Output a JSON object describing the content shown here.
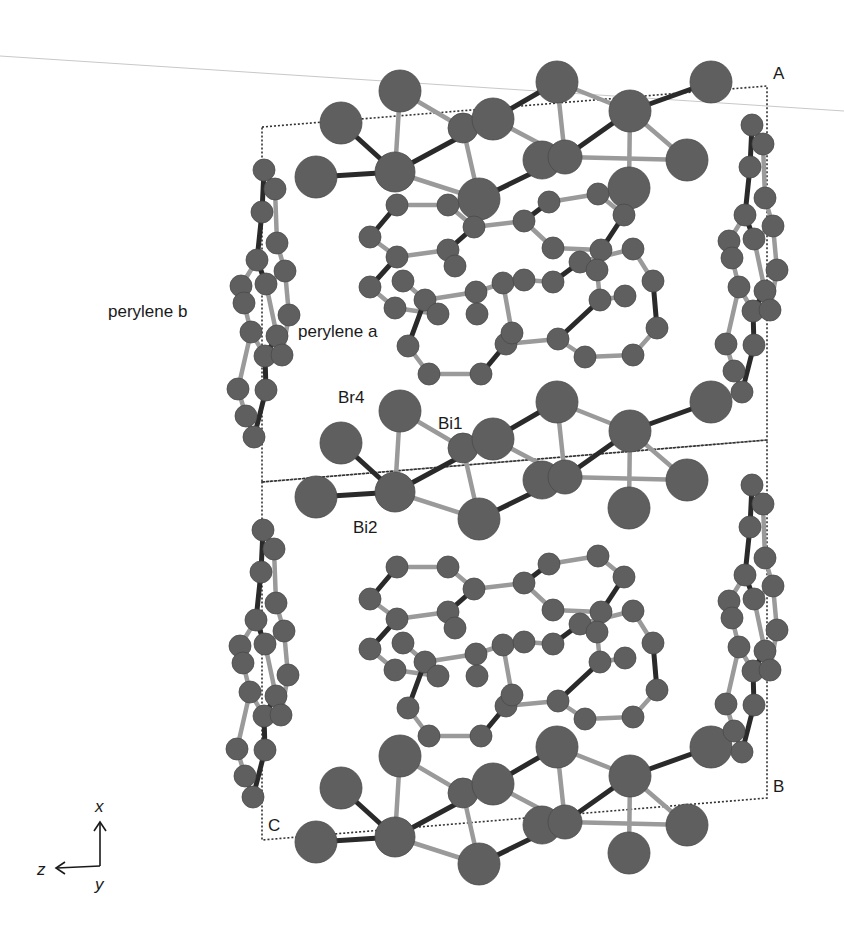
{
  "figure": {
    "colors": {
      "atom": "#5f5f5f",
      "atom_edge": "#4a4a4a",
      "bond_dark": "#2a2a2a",
      "bond_light": "#9a9a9a",
      "cell": "#333333",
      "text": "#1a1a1a",
      "guide_line": "#c8c8c8"
    }
  },
  "labels": {
    "perylene_a": "perylene a",
    "perylene_b": "perylene b",
    "br4": "Br4",
    "bi1": "Bi1",
    "bi2": "Bi2",
    "corner_a": "A",
    "corner_b": "B",
    "corner_c": "C"
  },
  "axes": {
    "x": "x",
    "y": "y",
    "z": "z"
  },
  "unit_cell": {
    "upper": [
      [
        262,
        127
      ],
      [
        767,
        86
      ],
      [
        767,
        440
      ],
      [
        262,
        482
      ]
    ],
    "lower": [
      [
        262,
        482
      ],
      [
        767,
        440
      ],
      [
        767,
        798
      ],
      [
        262,
        840
      ]
    ]
  },
  "inorganic_layer": {
    "atoms": [
      {
        "x": 400,
        "y": 411,
        "r": 21
      },
      {
        "x": 341,
        "y": 443,
        "r": 21
      },
      {
        "x": 316,
        "y": 497,
        "r": 21
      },
      {
        "x": 395,
        "y": 492,
        "r": 20
      },
      {
        "x": 463,
        "y": 448,
        "r": 15
      },
      {
        "x": 493,
        "y": 439,
        "r": 21
      },
      {
        "x": 479,
        "y": 519,
        "r": 21
      },
      {
        "x": 557,
        "y": 402,
        "r": 21
      },
      {
        "x": 542,
        "y": 480,
        "r": 19
      },
      {
        "x": 565,
        "y": 477,
        "r": 17
      },
      {
        "x": 630,
        "y": 431,
        "r": 21
      },
      {
        "x": 711,
        "y": 402,
        "r": 21
      },
      {
        "x": 687,
        "y": 480,
        "r": 21
      },
      {
        "x": 629,
        "y": 508,
        "r": 21
      }
    ],
    "bonds": [
      [
        0,
        3,
        "light"
      ],
      [
        1,
        3,
        "dark"
      ],
      [
        2,
        3,
        "dark"
      ],
      [
        3,
        5,
        "dark"
      ],
      [
        3,
        6,
        "light"
      ],
      [
        0,
        4,
        "light"
      ],
      [
        4,
        6,
        "light"
      ],
      [
        5,
        7,
        "dark"
      ],
      [
        5,
        9,
        "light"
      ],
      [
        6,
        9,
        "dark"
      ],
      [
        7,
        9,
        "light"
      ],
      [
        7,
        10,
        "light"
      ],
      [
        9,
        10,
        "dark"
      ],
      [
        9,
        12,
        "light"
      ],
      [
        10,
        11,
        "dark"
      ],
      [
        10,
        12,
        "light"
      ],
      [
        10,
        13,
        "light"
      ],
      [
        4,
        5,
        "dark"
      ]
    ],
    "offsets_y": [
      -320,
      0,
      345
    ]
  },
  "perylene_a": {
    "atoms": [
      {
        "x": 397,
        "y": 205
      },
      {
        "x": 448,
        "y": 205
      },
      {
        "x": 474,
        "y": 227
      },
      {
        "x": 524,
        "y": 221
      },
      {
        "x": 549,
        "y": 202
      },
      {
        "x": 598,
        "y": 194
      },
      {
        "x": 624,
        "y": 215
      },
      {
        "x": 601,
        "y": 250
      },
      {
        "x": 553,
        "y": 248
      },
      {
        "x": 448,
        "y": 250
      },
      {
        "x": 397,
        "y": 257
      },
      {
        "x": 370,
        "y": 237
      },
      {
        "x": 370,
        "y": 287
      },
      {
        "x": 395,
        "y": 308
      },
      {
        "x": 425,
        "y": 300
      },
      {
        "x": 476,
        "y": 292
      },
      {
        "x": 503,
        "y": 283
      },
      {
        "x": 524,
        "y": 280
      },
      {
        "x": 553,
        "y": 282
      },
      {
        "x": 580,
        "y": 262
      },
      {
        "x": 633,
        "y": 249
      },
      {
        "x": 653,
        "y": 281
      },
      {
        "x": 657,
        "y": 328
      },
      {
        "x": 633,
        "y": 355
      },
      {
        "x": 585,
        "y": 357
      },
      {
        "x": 558,
        "y": 339
      },
      {
        "x": 506,
        "y": 344
      },
      {
        "x": 481,
        "y": 374
      },
      {
        "x": 429,
        "y": 374
      },
      {
        "x": 408,
        "y": 346
      },
      {
        "x": 438,
        "y": 314
      },
      {
        "x": 477,
        "y": 314
      },
      {
        "x": 512,
        "y": 333
      },
      {
        "x": 600,
        "y": 300
      },
      {
        "x": 625,
        "y": 296
      },
      {
        "x": 455,
        "y": 266
      },
      {
        "x": 403,
        "y": 281
      },
      {
        "x": 597,
        "y": 270
      }
    ],
    "bonds": [
      [
        0,
        1,
        "light"
      ],
      [
        1,
        2,
        "light"
      ],
      [
        2,
        3,
        "light"
      ],
      [
        3,
        4,
        "dark"
      ],
      [
        4,
        5,
        "light"
      ],
      [
        5,
        6,
        "light"
      ],
      [
        6,
        7,
        "dark"
      ],
      [
        7,
        8,
        "light"
      ],
      [
        8,
        3,
        "light"
      ],
      [
        2,
        9,
        "dark"
      ],
      [
        9,
        10,
        "light"
      ],
      [
        10,
        11,
        "light"
      ],
      [
        11,
        0,
        "dark"
      ],
      [
        10,
        12,
        "dark"
      ],
      [
        12,
        13,
        "light"
      ],
      [
        9,
        35,
        "dark"
      ],
      [
        13,
        30,
        "light"
      ],
      [
        30,
        14,
        "dark"
      ],
      [
        14,
        15,
        "light"
      ],
      [
        15,
        16,
        "light"
      ],
      [
        16,
        17,
        "light"
      ],
      [
        17,
        18,
        "light"
      ],
      [
        18,
        19,
        "dark"
      ],
      [
        19,
        20,
        "light"
      ],
      [
        20,
        21,
        "light"
      ],
      [
        21,
        22,
        "dark"
      ],
      [
        22,
        23,
        "light"
      ],
      [
        23,
        24,
        "light"
      ],
      [
        24,
        25,
        "light"
      ],
      [
        25,
        26,
        "light"
      ],
      [
        26,
        27,
        "dark"
      ],
      [
        27,
        28,
        "light"
      ],
      [
        28,
        29,
        "light"
      ],
      [
        29,
        14,
        "dark"
      ],
      [
        25,
        33,
        "dark"
      ],
      [
        33,
        34,
        "light"
      ],
      [
        16,
        32,
        "light"
      ],
      [
        32,
        26,
        "dark"
      ],
      [
        31,
        15,
        "light"
      ],
      [
        36,
        14,
        "light"
      ],
      [
        37,
        19,
        "light"
      ],
      [
        37,
        33,
        "light"
      ]
    ],
    "offsets_y": [
      0,
      362
    ]
  },
  "perylene_b": {
    "atoms": [
      {
        "x": 264,
        "y": 170
      },
      {
        "x": 275,
        "y": 189
      },
      {
        "x": 262,
        "y": 212
      },
      {
        "x": 277,
        "y": 243
      },
      {
        "x": 257,
        "y": 260
      },
      {
        "x": 241,
        "y": 286
      },
      {
        "x": 285,
        "y": 271
      },
      {
        "x": 266,
        "y": 284
      },
      {
        "x": 244,
        "y": 303
      },
      {
        "x": 289,
        "y": 315
      },
      {
        "x": 251,
        "y": 332
      },
      {
        "x": 277,
        "y": 336
      },
      {
        "x": 265,
        "y": 356
      },
      {
        "x": 266,
        "y": 390
      },
      {
        "x": 246,
        "y": 416
      },
      {
        "x": 254,
        "y": 437
      },
      {
        "x": 238,
        "y": 389
      },
      {
        "x": 282,
        "y": 355
      }
    ],
    "bonds": [
      [
        0,
        1,
        "light"
      ],
      [
        0,
        2,
        "dark"
      ],
      [
        1,
        3,
        "light"
      ],
      [
        2,
        4,
        "dark"
      ],
      [
        3,
        6,
        "light"
      ],
      [
        4,
        5,
        "light"
      ],
      [
        4,
        7,
        "dark"
      ],
      [
        6,
        7,
        "light"
      ],
      [
        5,
        8,
        "light"
      ],
      [
        8,
        10,
        "light"
      ],
      [
        7,
        11,
        "light"
      ],
      [
        6,
        9,
        "light"
      ],
      [
        9,
        17,
        "light"
      ],
      [
        10,
        12,
        "light"
      ],
      [
        11,
        12,
        "dark"
      ],
      [
        12,
        13,
        "dark"
      ],
      [
        13,
        15,
        "dark"
      ],
      [
        10,
        16,
        "light"
      ],
      [
        16,
        14,
        "light"
      ],
      [
        14,
        15,
        "light"
      ]
    ],
    "placements": [
      {
        "dx": 0,
        "dy": 0
      },
      {
        "dx": -1,
        "dy": 360
      },
      {
        "dx": 488,
        "dy": -45
      },
      {
        "dx": 488,
        "dy": 315
      }
    ]
  },
  "axes_glyph": {
    "origin": [
      100,
      870
    ],
    "x_tip": [
      100,
      823
    ],
    "z_tip": [
      57,
      874
    ]
  }
}
